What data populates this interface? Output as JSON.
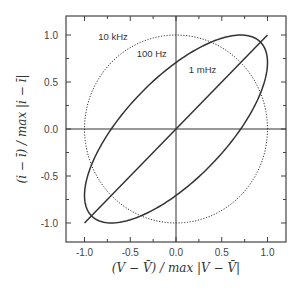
{
  "chart_data": {
    "type": "line",
    "title": "",
    "xlabel": "(V − V̄) / max |V − V̄|",
    "ylabel": "(i − ī) / max |i − ī|",
    "xlim": [
      -1.2,
      1.2
    ],
    "ylim": [
      -1.2,
      1.2
    ],
    "x_ticks": [
      -1.0,
      -0.5,
      0.0,
      0.5,
      1.0
    ],
    "x_tick_labels": [
      "-1.0",
      "-0.5",
      "0.0",
      "0.5",
      "1.0"
    ],
    "y_ticks": [
      -1.0,
      -0.5,
      0.0,
      0.5,
      1.0
    ],
    "y_tick_labels": [
      "-1.0",
      "-0.5",
      "0.0",
      "0.5",
      "1.0"
    ],
    "grid": false,
    "legend": null,
    "series": [
      {
        "name": "1 mHz",
        "style": "solid",
        "shape": "line",
        "phase_deg": 0,
        "points": [
          [
            -1.0,
            -1.0
          ],
          [
            1.0,
            1.0
          ]
        ]
      },
      {
        "name": "100 Hz",
        "style": "solid",
        "shape": "ellipse",
        "phase_deg": 45,
        "points": [
          [
            1.0,
            0.71
          ],
          [
            0.71,
            1.0
          ],
          [
            0.0,
            0.71
          ],
          [
            -0.71,
            0.0
          ],
          [
            -1.0,
            -0.71
          ],
          [
            -0.71,
            -1.0
          ],
          [
            0.0,
            -0.71
          ],
          [
            0.71,
            0.0
          ]
        ]
      },
      {
        "name": "10 kHz",
        "style": "dotted",
        "shape": "circle",
        "phase_deg": 90,
        "points": [
          [
            1.0,
            0.0
          ],
          [
            0.0,
            1.0
          ],
          [
            -1.0,
            0.0
          ],
          [
            0.0,
            -1.0
          ]
        ]
      }
    ],
    "annotations": [
      {
        "text": "10 kHz",
        "x": -0.85,
        "y": 0.95
      },
      {
        "text": "100 Hz",
        "x": -0.43,
        "y": 0.77
      },
      {
        "text": "1 mHz",
        "x": 0.14,
        "y": 0.6
      }
    ]
  }
}
